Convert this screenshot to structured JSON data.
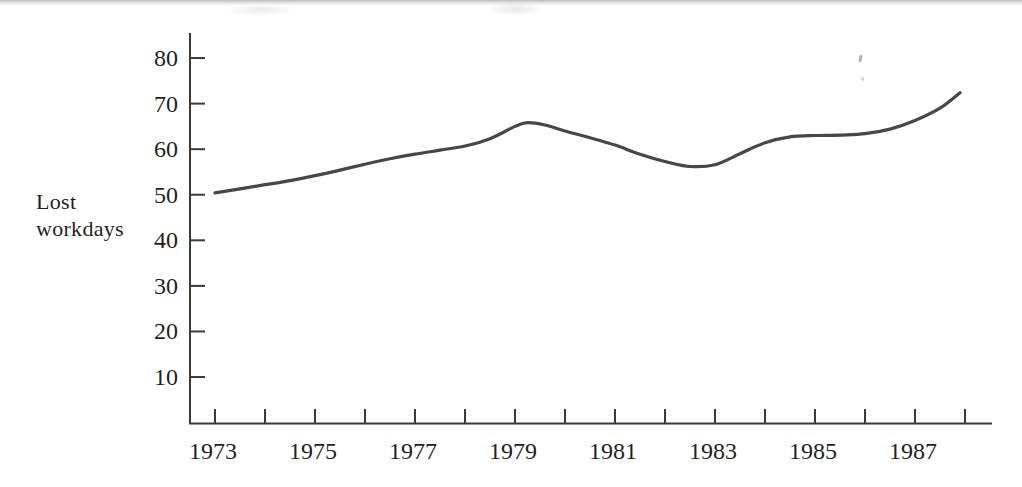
{
  "page": {
    "background": "#ffffff",
    "top_rule_color": "#bdbdbd"
  },
  "chart_data": {
    "type": "line",
    "title": "",
    "xlabel": "",
    "ylabel": "Lost workdays",
    "ylabel_lines": [
      "Lost",
      "workdays"
    ],
    "x_ticks": [
      1973,
      1974,
      1975,
      1976,
      1977,
      1978,
      1979,
      1980,
      1981,
      1982,
      1983,
      1984,
      1985,
      1986,
      1987,
      1988
    ],
    "x_tick_labels": [
      "1973",
      "1975",
      "1977",
      "1979",
      "1981",
      "1983",
      "1985",
      "1987"
    ],
    "x_labeled_years": [
      1973,
      1975,
      1977,
      1979,
      1981,
      1983,
      1985,
      1987
    ],
    "y_ticks": [
      10,
      20,
      30,
      40,
      50,
      60,
      70,
      80
    ],
    "y_tick_labels": [
      "10",
      "20",
      "30",
      "40",
      "50",
      "60",
      "70",
      "80"
    ],
    "xlim": [
      1972.5,
      1988.55
    ],
    "ylim": [
      0,
      86
    ],
    "grid": false,
    "legend": null,
    "style": {
      "curve_color": "#474747",
      "axis_color": "#3a3a3a",
      "text_color": "#1f1f1f",
      "curve_width": 3.2
    },
    "series": [
      {
        "name": "Lost workdays",
        "color": "#474747",
        "x": [
          1973,
          1973.5,
          1974,
          1974.5,
          1975,
          1975.5,
          1976,
          1976.5,
          1977,
          1977.5,
          1978,
          1978.5,
          1979,
          1979.25,
          1979.6,
          1980,
          1980.5,
          1981,
          1981.5,
          1982,
          1982.5,
          1983,
          1983.5,
          1984,
          1984.5,
          1985,
          1985.5,
          1986,
          1986.5,
          1987,
          1987.5,
          1987.9
        ],
        "y": [
          50.4,
          51.3,
          52.2,
          53.1,
          54.2,
          55.4,
          56.7,
          57.9,
          58.9,
          59.8,
          60.7,
          62.3,
          65.0,
          65.8,
          65.3,
          64.0,
          62.5,
          60.9,
          58.9,
          57.3,
          56.2,
          56.6,
          59.0,
          61.4,
          62.7,
          63.0,
          63.1,
          63.4,
          64.4,
          66.3,
          69.0,
          72.4
        ]
      }
    ]
  }
}
